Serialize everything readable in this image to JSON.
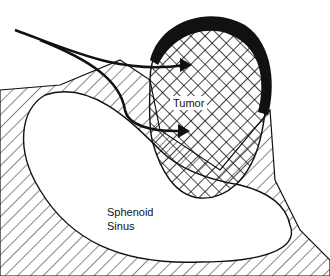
{
  "labels": {
    "tumor": "Tumor",
    "sinus_line1": "Sphenoid",
    "sinus_line2": "Sinus"
  },
  "colors": {
    "ink": "#111111",
    "background": "#ffffff"
  }
}
